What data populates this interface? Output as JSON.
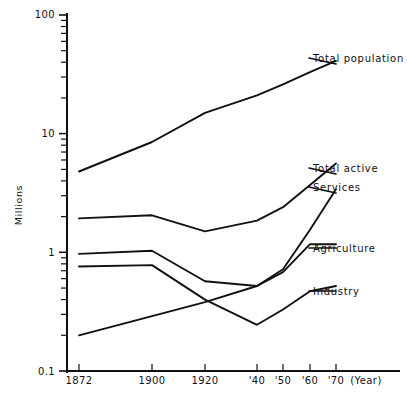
{
  "chart_data": {
    "type": "line",
    "title": "",
    "subtitle": "",
    "xlabel": "(Year)",
    "ylabel": "Millions",
    "yscale": "log",
    "ylim": [
      0.1,
      100
    ],
    "y_major_ticks": [
      "0.1",
      "1",
      "10",
      "100"
    ],
    "grid": false,
    "legend_position": "inline-right-labels",
    "x": [
      1872,
      1900,
      1920,
      1940,
      1950,
      1960,
      1970
    ],
    "categories": [
      "1872",
      "1900",
      "1920",
      "'40",
      "'50",
      "'60",
      "'70"
    ],
    "series": [
      {
        "name": "Total population",
        "values": [
          4.8,
          8.5,
          15.0,
          21.0,
          26.0,
          33.0,
          41.0
        ]
      },
      {
        "name": "Total active",
        "values": [
          1.93,
          2.05,
          1.5,
          1.85,
          2.4,
          3.7,
          5.6
        ]
      },
      {
        "name": "Services",
        "values": [
          0.2,
          0.29,
          0.38,
          0.52,
          0.72,
          1.55,
          3.4
        ]
      },
      {
        "name": "Agriculture",
        "values": [
          0.97,
          1.03,
          0.57,
          0.52,
          0.68,
          1.17,
          1.17
        ]
      },
      {
        "name": "Industry",
        "values": [
          0.76,
          0.78,
          0.4,
          0.245,
          0.33,
          0.47,
          0.52
        ]
      }
    ],
    "series_labels": [
      {
        "name": "Total population",
        "label": "Total population"
      },
      {
        "name": "Total active",
        "label": "Total active"
      },
      {
        "name": "Services",
        "label": "Services"
      },
      {
        "name": "Agriculture",
        "label": "Agriculture"
      },
      {
        "name": "Industry",
        "label": "Industry"
      }
    ]
  },
  "axes": {
    "y_label": "Millions",
    "y_ticks": {
      "t100": "100",
      "t10": "10",
      "t1": "1",
      "t01": "0.1"
    },
    "x_ticks": {
      "t1872": "1872",
      "t1900": "1900",
      "t1920": "1920",
      "t40": "'40",
      "t50": "'50",
      "t60": "'60",
      "t70": "'70"
    },
    "x_unit": "(Year)"
  },
  "labels": {
    "total_population": "Total population",
    "total_active": "Total active",
    "services": "Services",
    "agriculture": "Agriculture",
    "industry": "Industry"
  }
}
